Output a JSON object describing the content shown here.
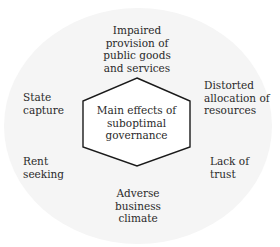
{
  "diagram": {
    "center": {
      "label": "Main effects of\nsuboptimal\ngovernance"
    },
    "effects": [
      {
        "id": "top",
        "label": "Impaired\nprovision of\npublic goods\nand services"
      },
      {
        "id": "upper-right",
        "label": "Distorted\nallocation of\nresources"
      },
      {
        "id": "lower-right",
        "label": "Lack of\ntrust"
      },
      {
        "id": "bottom",
        "label": "Adverse\nbusiness\nclimate"
      },
      {
        "id": "lower-left",
        "label": "Rent\nseeking"
      },
      {
        "id": "upper-left",
        "label": "State\ncapture"
      }
    ],
    "colors": {
      "background": "#ffffff",
      "ellipse_fill": "#f5f5f5",
      "hexagon_stroke": "#1a1a1a",
      "hexagon_fill": "#ffffff",
      "text": "#2a2a2a"
    }
  }
}
